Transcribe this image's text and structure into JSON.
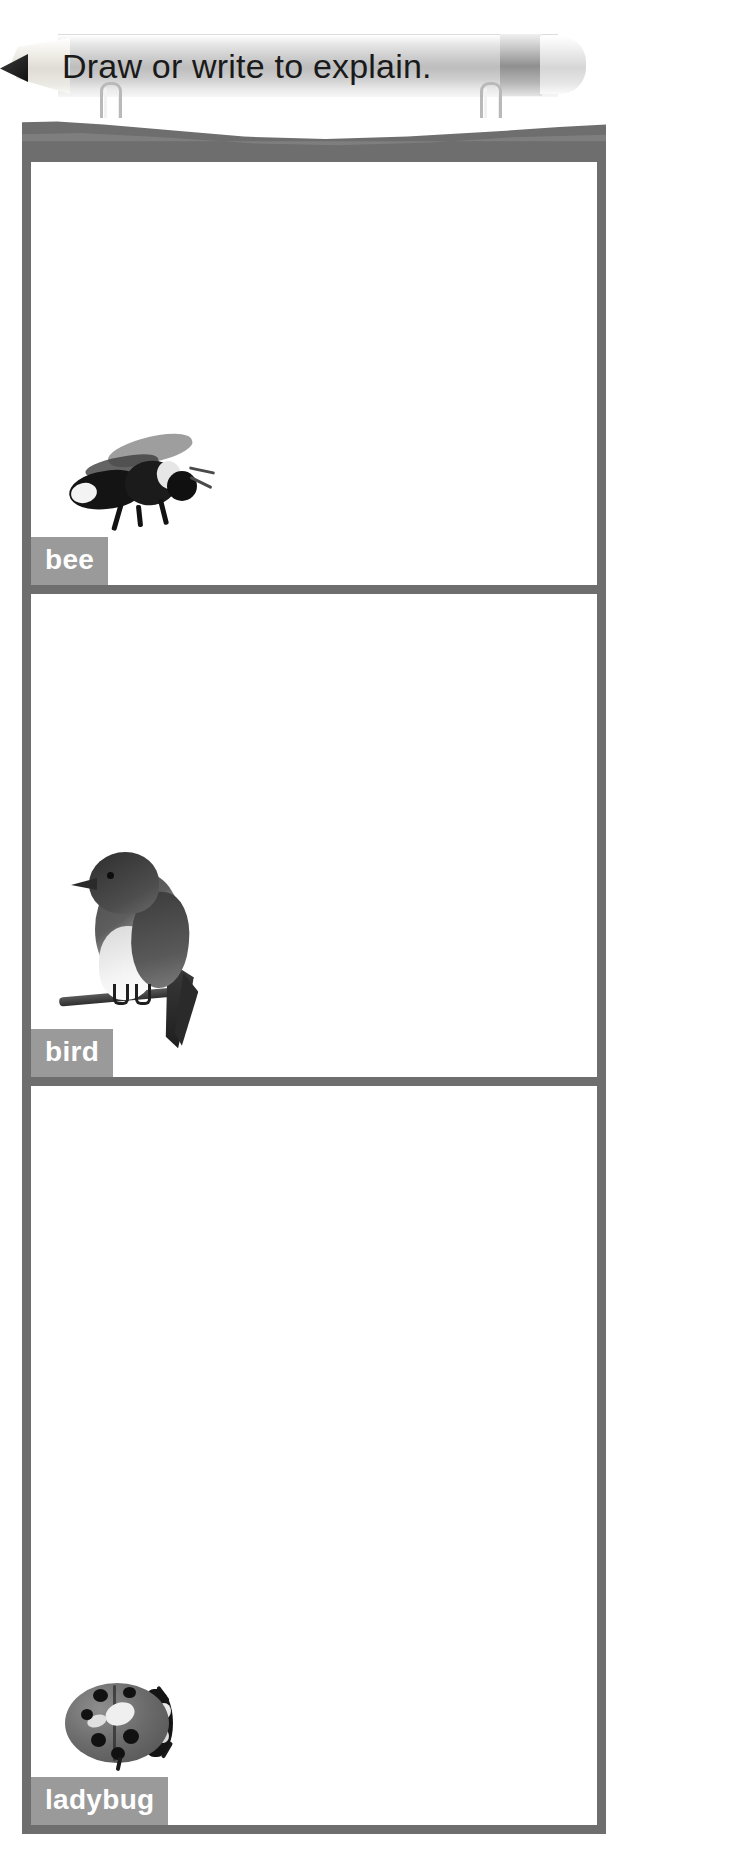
{
  "header": {
    "instruction": "Draw or write to explain.",
    "pencil_icon": "pencil-graphic",
    "binding": {
      "ring_left": "spiral-ring",
      "ring_right": "spiral-ring"
    }
  },
  "worksheet": {
    "panels": [
      {
        "label": "bee",
        "image": "bee-photo"
      },
      {
        "label": "bird",
        "image": "bird-photo"
      },
      {
        "label": "ladybug",
        "image": "ladybug-photo"
      }
    ]
  },
  "colors": {
    "border_gray": "#6e6e6e",
    "tag_gray": "#9a9a9a",
    "tag_text": "#ffffff",
    "page_white": "#ffffff",
    "title_text": "#1a1a1a"
  }
}
